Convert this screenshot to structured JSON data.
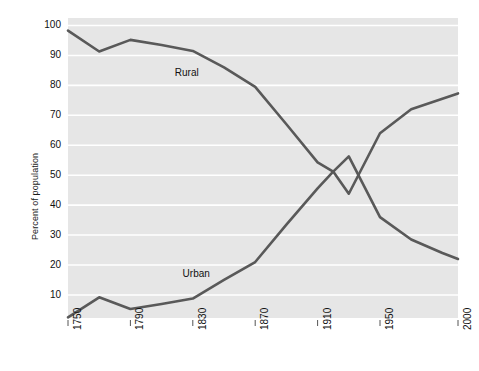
{
  "chart_data": {
    "type": "line",
    "title": "",
    "subtitle": "",
    "xlabel": "",
    "ylabel": "Percent of population",
    "xlim": [
      1750,
      2000
    ],
    "ylim": [
      2.3,
      102.5
    ],
    "grid": "horizontal",
    "legend_position": "inline-annotations",
    "plot_background": "#e6e6e6",
    "line_color": "#595959",
    "xticks": [
      1750,
      1790,
      1830,
      1870,
      1910,
      1950,
      2000
    ],
    "xtick_labels": [
      "1750",
      "1790",
      "1830",
      "1870",
      "1910",
      "1950",
      "2000"
    ],
    "yticks": [
      10,
      20,
      30,
      40,
      50,
      60,
      70,
      80,
      90,
      100
    ],
    "ytick_labels": [
      "10",
      "20",
      "30",
      "40",
      "50",
      "60",
      "70",
      "80",
      "90",
      "100"
    ],
    "annotations": [
      {
        "text": "Rural",
        "x": 1830,
        "y": 84
      },
      {
        "text": "Urban",
        "x": 1835,
        "y": 17
      }
    ],
    "series": [
      {
        "name": "Rural",
        "x": [
          1750,
          1770,
          1790,
          1810,
          1830,
          1850,
          1870,
          1890,
          1910,
          1920,
          1930,
          1950,
          1970,
          1990,
          2000
        ],
        "values": [
          98.3,
          91.3,
          95.2,
          93.5,
          91.5,
          86.0,
          79.5,
          67.0,
          54.3,
          51.2,
          56.3,
          36.0,
          28.5,
          24.0,
          22.0
        ]
      },
      {
        "name": "Urban",
        "x": [
          1750,
          1770,
          1790,
          1810,
          1830,
          1850,
          1870,
          1890,
          1910,
          1920,
          1930,
          1950,
          1970,
          1990,
          2000
        ],
        "values": [
          2.5,
          9.2,
          5.3,
          7.0,
          8.8,
          15.0,
          21.0,
          33.5,
          45.6,
          51.2,
          43.8,
          64.0,
          72.0,
          75.5,
          77.3
        ]
      }
    ]
  }
}
